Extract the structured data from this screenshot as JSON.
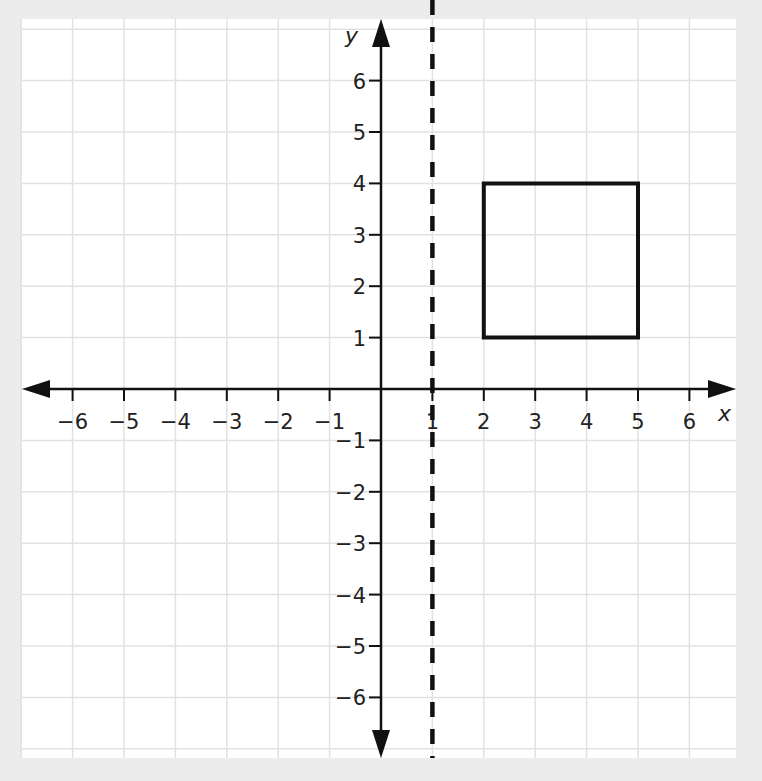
{
  "chart_data": {
    "type": "coordinate-plane",
    "title": "",
    "xlabel": "x",
    "ylabel": "y",
    "xlim": [
      -7,
      6.9
    ],
    "ylim": [
      -7.2,
      7.2
    ],
    "grid": true,
    "x_ticks": [
      -6,
      -5,
      -4,
      -3,
      -2,
      -1,
      1,
      2,
      3,
      4,
      5,
      6
    ],
    "y_ticks": [
      -6,
      -5,
      -4,
      -3,
      -2,
      -1,
      1,
      2,
      3,
      4,
      5,
      6
    ],
    "x_tick_labels": [
      "−6",
      "−5",
      "−4",
      "−3",
      "−2",
      "−1",
      "1",
      "2",
      "3",
      "4",
      "5",
      "6"
    ],
    "y_tick_labels": [
      "−6",
      "−5",
      "−4",
      "−3",
      "−2",
      "−1",
      "1",
      "2",
      "3",
      "4",
      "5",
      "6"
    ],
    "shapes": [
      {
        "type": "polygon",
        "name": "rectangle",
        "vertices": [
          [
            2,
            1
          ],
          [
            5,
            1
          ],
          [
            5,
            4
          ],
          [
            2,
            4
          ]
        ],
        "stroke": "#111111",
        "fill": "none"
      }
    ],
    "lines": [
      {
        "type": "vertical",
        "name": "line of reflection",
        "equation": "x = 1",
        "x": 1,
        "style": "dashed",
        "color": "#111111"
      }
    ]
  },
  "colors": {
    "background": "#ececec",
    "plot_background": "#ffffff",
    "grid": "#e2e2e2",
    "axis": "#111111"
  }
}
